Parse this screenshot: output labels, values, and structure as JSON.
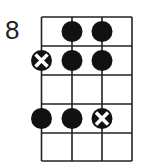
{
  "diagram": {
    "type": "fretboard-scale-diagram",
    "start_fret_label": "8",
    "strings": 4,
    "frets": 5,
    "colors": {
      "line": "#222222",
      "dot": "#111111",
      "x_mark": "#ffffff"
    },
    "markers": [
      {
        "string": 2,
        "fret": 1,
        "kind": "dot"
      },
      {
        "string": 3,
        "fret": 1,
        "kind": "dot"
      },
      {
        "string": 1,
        "fret": 2,
        "kind": "root-x"
      },
      {
        "string": 2,
        "fret": 2,
        "kind": "dot"
      },
      {
        "string": 3,
        "fret": 2,
        "kind": "dot"
      },
      {
        "string": 1,
        "fret": 4,
        "kind": "dot"
      },
      {
        "string": 2,
        "fret": 4,
        "kind": "dot"
      },
      {
        "string": 3,
        "fret": 4,
        "kind": "root-x"
      }
    ]
  }
}
